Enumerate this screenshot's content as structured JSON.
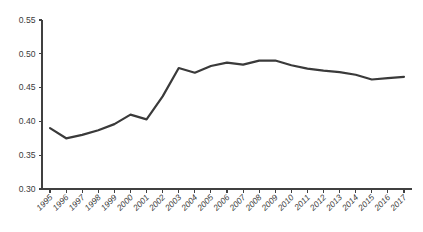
{
  "chart_data": {
    "type": "line",
    "title": "",
    "subtitle": "",
    "xlabel": "",
    "ylabel": "",
    "grid": false,
    "legend": false,
    "legend_position": "none",
    "line_color": "#3a3a3a",
    "axis_color": "#404040",
    "background_color": "#ffffff",
    "ylim": [
      0.3,
      0.55
    ],
    "yticks": [
      0.3,
      0.35,
      0.4,
      0.45,
      0.5,
      0.55
    ],
    "ytick_labels": [
      "0.30",
      "0.35",
      "0.40",
      "0.45",
      "0.50",
      "0.55"
    ],
    "categories": [
      "1995",
      "1996",
      "1997",
      "1998",
      "1999",
      "2000",
      "2001",
      "2002",
      "2003",
      "2004",
      "2005",
      "2006",
      "2007",
      "2008",
      "2009",
      "2010",
      "2011",
      "2012",
      "2013",
      "2014",
      "2015",
      "2016",
      "2017"
    ],
    "x": [
      1995,
      1996,
      1997,
      1998,
      1999,
      2000,
      2001,
      2002,
      2003,
      2004,
      2005,
      2006,
      2007,
      2008,
      2009,
      2010,
      2011,
      2012,
      2013,
      2014,
      2015,
      2016,
      2017
    ],
    "values": [
      0.39,
      0.375,
      0.38,
      0.387,
      0.396,
      0.41,
      0.403,
      0.437,
      0.479,
      0.472,
      0.482,
      0.487,
      0.484,
      0.49,
      0.49,
      0.483,
      0.478,
      0.475,
      0.473,
      0.469,
      0.462,
      0.464,
      0.466
    ],
    "series": [
      {
        "name": "series-1",
        "values": [
          0.39,
          0.375,
          0.38,
          0.387,
          0.396,
          0.41,
          0.403,
          0.437,
          0.479,
          0.472,
          0.482,
          0.487,
          0.484,
          0.49,
          0.49,
          0.483,
          0.478,
          0.475,
          0.473,
          0.469,
          0.462,
          0.464,
          0.466
        ]
      }
    ],
    "annotations": []
  },
  "plot_geometry": {
    "left": 42,
    "right": 412,
    "top": 20,
    "bottom": 189
  }
}
